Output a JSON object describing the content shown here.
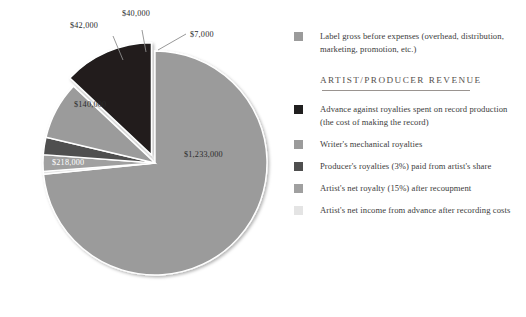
{
  "chart_data": {
    "type": "pie",
    "title": "",
    "total": 1633000,
    "start_angle_deg": 0,
    "direction": "clockwise",
    "categories": [
      "Label gross before expenses (overhead, distribution, marketing, promotion, etc.)",
      "Artist's net income from advance after recording costs",
      "Artist's net royalty (15%) after recoupment",
      "Producer's royalties (3%) paid from artist's share",
      "Writer's mechanical royalties",
      "Advance against royalties spent on record production (the cost of making the record)"
    ],
    "values": [
      1233000,
      7000,
      40000,
      42000,
      140000,
      218000
    ],
    "labels": [
      "$1,233,000",
      "$7,000",
      "$40,000",
      "$42,000",
      "$140,000",
      "$218,000"
    ],
    "colors": [
      "#9b9b9b",
      "#e4e4e4",
      "#a0a0a0",
      "#4f4f4f",
      "#9b9b9b",
      "#201f1f"
    ],
    "exploded": [
      false,
      false,
      false,
      false,
      false,
      true
    ],
    "slices": [
      {
        "label": "$1,233,000",
        "value": 1233000,
        "color": "#9b9b9b",
        "placement": "inside"
      },
      {
        "label": "$7,000",
        "value": 7000,
        "color": "#e4e4e4",
        "placement": "callout"
      },
      {
        "label": "$40,000",
        "value": 40000,
        "color": "#a0a0a0",
        "placement": "callout"
      },
      {
        "label": "$42,000",
        "value": 42000,
        "color": "#4f4f4f",
        "placement": "callout"
      },
      {
        "label": "$140,000",
        "value": 140000,
        "color": "#9b9b9b",
        "placement": "inside"
      },
      {
        "label": "$218,000",
        "value": 218000,
        "color": "#201f1f",
        "placement": "inside"
      }
    ],
    "legend_position": "right",
    "grid": false
  },
  "labels": {
    "main": "$1,233,000",
    "black": "$218,000",
    "gray_mid": "$140,000",
    "dark_small": "$42,000",
    "gray_small": "$40,000",
    "light_small": "$7,000"
  },
  "legend": {
    "top": [
      {
        "swatch": "#9b9b9b",
        "text": "Label gross before expenses (overhead, distribution, marketing, promotion, etc.)"
      }
    ],
    "section_title": "ARTIST/PRODUCER REVENUE",
    "items": [
      {
        "swatch": "#201f1f",
        "text": "Advance against royalties spent on record production (the cost of making the record)"
      },
      {
        "swatch": "#9b9b9b",
        "text": "Writer's mechanical royalties"
      },
      {
        "swatch": "#4f4f4f",
        "text": "Producer's royalties (3%) paid from artist's share"
      },
      {
        "swatch": "#a0a0a0",
        "text": "Artist's net royalty (15%) after recoupment"
      },
      {
        "swatch": "#e4e4e4",
        "text": "Artist's net income from advance after recording costs"
      }
    ]
  },
  "colors": {
    "background": "#ffffff",
    "text": "#3b3b3b",
    "rule": "#9a9490",
    "pie_light": "#9b9b9b",
    "pie_black": "#201f1f",
    "pie_dark": "#4f4f4f",
    "pie_pale": "#e4e4e4",
    "leader": "#8d8d8d"
  }
}
